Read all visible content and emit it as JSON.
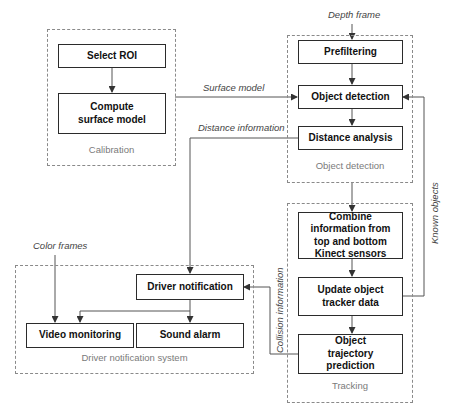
{
  "diagram": {
    "groups": {
      "calibration": "Calibration",
      "object_detection": "Object detection",
      "tracking": "Tracking",
      "driver_notification_system": "Driver notification system"
    },
    "nodes": {
      "select_roi": "Select ROI",
      "compute_surface_model": "Compute surface model",
      "prefiltering": "Prefiltering",
      "object_detection": "Object detection",
      "distance_analysis": "Distance analysis",
      "combine_information": "Combine information from top and bottom Kinect sensors",
      "update_tracker": "Update object tracker data",
      "trajectory_prediction": "Object trajectory prediction",
      "driver_notification": "Driver notification",
      "video_monitoring": "Video monitoring",
      "sound_alarm": "Sound alarm"
    },
    "edge_labels": {
      "depth_frame": "Depth frame",
      "surface_model": "Surface model",
      "distance_information": "Distance information",
      "known_objects": "Known objects",
      "color_frames": "Color frames",
      "collision_information": "Collision information"
    },
    "colors": {
      "box_border": "#2b2b2b",
      "group_border": "#8a8a8a",
      "group_label": "#7a7a7a",
      "wire": "#555555"
    }
  }
}
